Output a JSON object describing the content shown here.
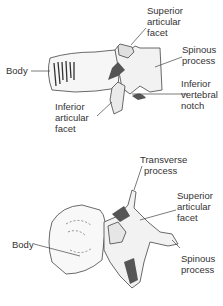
{
  "figures": [
    {
      "id": "lateral-view",
      "labels": {
        "superior_articular_facet": [
          "Superior",
          "articular",
          "facet"
        ],
        "spinous_process": [
          "Spinous",
          "process"
        ],
        "body": [
          "Body"
        ],
        "inferior_vertebral_notch": [
          "Inferior",
          "vertebral",
          "notch"
        ],
        "inferior_articular_facet": [
          "Inferior",
          "articular",
          "facet"
        ]
      }
    },
    {
      "id": "superior-view",
      "labels": {
        "transverse_process": [
          "Transverse",
          "process"
        ],
        "superior_articular_facet": [
          "Superior",
          "articular",
          "facet"
        ],
        "body": [
          "Body"
        ],
        "spinous_process": [
          "Spinous",
          "process"
        ]
      }
    }
  ]
}
